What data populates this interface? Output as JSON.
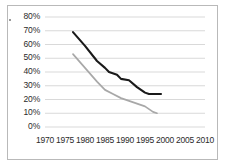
{
  "chart_data": {
    "type": "line",
    "title": "",
    "xlabel": "",
    "ylabel": "",
    "xlim": [
      1970,
      2010
    ],
    "ylim": [
      0,
      80
    ],
    "grid": true,
    "legend": "none",
    "x_ticks": [
      "1970",
      "1975",
      "1980",
      "1985",
      "1990",
      "1995",
      "2000",
      "2005",
      "2010"
    ],
    "y_ticks": [
      "0%",
      "10%",
      "20%",
      "30%",
      "40%",
      "50%",
      "60%",
      "70%",
      "80%"
    ],
    "series": [
      {
        "name": "upper-series",
        "color": "#1a1a1a",
        "points": [
          {
            "x": 1977,
            "y": 69
          },
          {
            "x": 1980,
            "y": 59
          },
          {
            "x": 1983,
            "y": 48
          },
          {
            "x": 1985,
            "y": 43
          },
          {
            "x": 1986,
            "y": 40
          },
          {
            "x": 1988,
            "y": 38
          },
          {
            "x": 1989,
            "y": 35
          },
          {
            "x": 1991,
            "y": 34
          },
          {
            "x": 1993,
            "y": 29
          },
          {
            "x": 1995,
            "y": 25
          },
          {
            "x": 1996,
            "y": 24
          },
          {
            "x": 1999,
            "y": 24
          }
        ]
      },
      {
        "name": "lower-series",
        "color": "#a8a8a8",
        "points": [
          {
            "x": 1977,
            "y": 53
          },
          {
            "x": 1980,
            "y": 43
          },
          {
            "x": 1983,
            "y": 33
          },
          {
            "x": 1985,
            "y": 27
          },
          {
            "x": 1987,
            "y": 24
          },
          {
            "x": 1989,
            "y": 21
          },
          {
            "x": 1991,
            "y": 19
          },
          {
            "x": 1993,
            "y": 17
          },
          {
            "x": 1995,
            "y": 15
          },
          {
            "x": 1997,
            "y": 11
          },
          {
            "x": 1998,
            "y": 10
          }
        ]
      }
    ]
  },
  "axes": {
    "y_labels": [
      {
        "text": "80%",
        "value": 80
      },
      {
        "text": "70%",
        "value": 70
      },
      {
        "text": "60%",
        "value": 60
      },
      {
        "text": "50%",
        "value": 50
      },
      {
        "text": "40%",
        "value": 40
      },
      {
        "text": "30%",
        "value": 30
      },
      {
        "text": "20%",
        "value": 20
      },
      {
        "text": "10%",
        "value": 10
      },
      {
        "text": "0%",
        "value": 0
      }
    ],
    "x_labels": [
      {
        "text": "1970",
        "value": 1970
      },
      {
        "text": "1975",
        "value": 1975
      },
      {
        "text": "1980",
        "value": 1980
      },
      {
        "text": "1985",
        "value": 1985
      },
      {
        "text": "1990",
        "value": 1990
      },
      {
        "text": "1995",
        "value": 1995
      },
      {
        "text": "2000",
        "value": 2000
      },
      {
        "text": "2005",
        "value": 2005
      },
      {
        "text": "2010",
        "value": 2010
      }
    ]
  },
  "colors": {
    "grid": "#cfcfcf",
    "frame": "#b9b9b9",
    "text": "#2b2b2b",
    "background": "#ffffff"
  }
}
